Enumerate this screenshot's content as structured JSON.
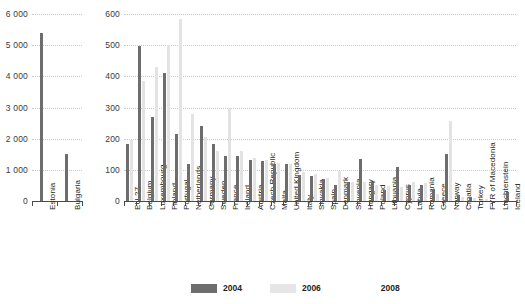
{
  "chart_data": {
    "type": "bar",
    "title": "",
    "panels": [
      {
        "name": "left-panel",
        "ylabel": "",
        "ylim": [
          0,
          6000
        ],
        "yticks": [
          0,
          1000,
          2000,
          3000,
          4000,
          5000,
          6000
        ],
        "ytick_labels": [
          "0",
          "1 000",
          "2 000",
          "3 000",
          "4 000",
          "5 000",
          "6 000"
        ],
        "categories": [
          "Estonia",
          "Bulgaria"
        ],
        "series": [
          {
            "name": "2004",
            "values": [
              5400,
              1520
            ]
          },
          {
            "name": "2006",
            "values": [
              null,
              null
            ]
          },
          {
            "name": "2008",
            "values": [
              null,
              null
            ]
          }
        ]
      },
      {
        "name": "right-panel",
        "ylabel": "",
        "ylim": [
          0,
          600
        ],
        "yticks": [
          0,
          100,
          200,
          300,
          400,
          500,
          600
        ],
        "ytick_labels": [
          "0",
          "100",
          "200",
          "300",
          "400",
          "500",
          "600"
        ],
        "categories": [
          "EU-27",
          "Belgium",
          "Luxembourg",
          "Finland",
          "Portugal",
          "Netherlands",
          "Germany",
          "Sweden",
          "France",
          "Ireland",
          "Austria",
          "Czech Republic",
          "Malta",
          "United Kingdom",
          "Italy",
          "Slovakia",
          "Spain",
          "Denmark",
          "Slovenia",
          "Hungary",
          "Poland",
          "Lithuania",
          "Cyprus",
          "Latvia",
          "Romania",
          "Greece",
          "Norway",
          "Croatia",
          "Turkey",
          "FYR of Macedonia",
          "Liechtenstein",
          "Iceland"
        ],
        "series": [
          {
            "name": "2004",
            "values": [
              183,
              497,
              268,
              412,
              215,
              120,
              240,
              182,
              145,
              143,
              132,
              128,
              120,
              118,
              85,
              80,
              72,
              50,
              60,
              135,
              60,
              35,
              108,
              50,
              50,
              40,
              150,
              20,
              14,
              0,
              0,
              30
            ]
          },
          {
            "name": "2006",
            "values": [
              196,
              385,
              430,
              500,
              585,
              280,
              205,
              160,
              300,
              160,
              137,
              132,
              123,
              120,
              92,
              88,
              75,
              95,
              62,
              60,
              50,
              47,
              45,
              62,
              58,
              22,
              258,
              12,
              10,
              5,
              0,
              0
            ]
          },
          {
            "name": "2008",
            "values": [
              null,
              null,
              null,
              null,
              null,
              null,
              null,
              null,
              null,
              null,
              null,
              null,
              null,
              null,
              null,
              null,
              null,
              null,
              null,
              null,
              null,
              null,
              null,
              null,
              null,
              null,
              null,
              null,
              null,
              null,
              null,
              null
            ]
          }
        ]
      }
    ],
    "legend": {
      "position": "bottom",
      "entries": [
        {
          "label": "2004",
          "color": "#6d6d6d"
        },
        {
          "label": "2006",
          "color": "#e6e6e6"
        },
        {
          "label": "2008",
          "color": "#ffffff"
        }
      ]
    },
    "grid": true
  }
}
